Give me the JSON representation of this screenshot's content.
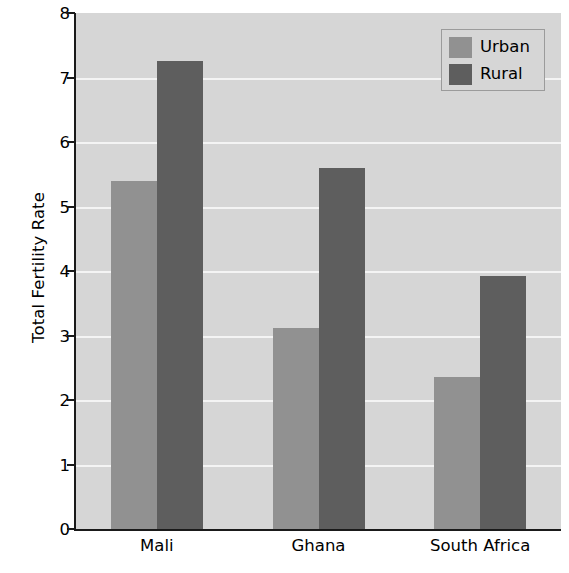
{
  "chart_data": {
    "type": "bar",
    "title": "",
    "subtitle": "",
    "xlabel": "",
    "ylabel": "Total Fertility Rate",
    "categories": [
      "Mali",
      "Ghana",
      "South Africa"
    ],
    "series": [
      {
        "name": "Urban",
        "color": "#919191",
        "values": [
          5.4,
          3.12,
          2.35
        ]
      },
      {
        "name": "Rural",
        "color": "#5e5e5e",
        "values": [
          7.25,
          5.6,
          3.93
        ]
      }
    ],
    "ylim": [
      0,
      8
    ],
    "ytick_labels": [
      "0",
      "1",
      "2",
      "3",
      "4",
      "5",
      "6",
      "7",
      "8"
    ],
    "ytick_values": [
      0,
      1,
      2,
      3,
      4,
      5,
      6,
      7,
      8
    ],
    "grid": true,
    "grid_color": "#f4f4f4",
    "plot_background": "#d6d6d6",
    "legend_position": "top-right",
    "legend_entries": [
      "Urban",
      "Rural"
    ]
  }
}
